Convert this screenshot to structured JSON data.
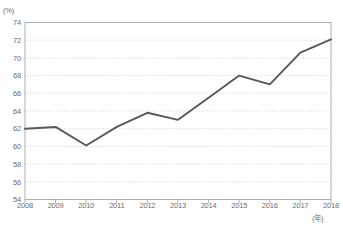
{
  "chart_data": {
    "type": "line",
    "title": "",
    "subtitle": "",
    "xlabel": "(年)",
    "ylabel": "(%)",
    "categories": [
      "2008",
      "2009",
      "2010",
      "2011",
      "2012",
      "2013",
      "2014",
      "2015",
      "2016",
      "2017",
      "2018"
    ],
    "x": [
      2008,
      2009,
      2010,
      2011,
      2012,
      2013,
      2014,
      2015,
      2016,
      2017,
      2018
    ],
    "values": [
      62.0,
      62.2,
      60.1,
      62.2,
      63.8,
      63.0,
      65.5,
      68.0,
      67.0,
      70.6,
      72.1
    ],
    "series": [
      {
        "name": "",
        "values": [
          62.0,
          62.2,
          60.1,
          62.2,
          63.8,
          63.0,
          65.5,
          68.0,
          67.0,
          70.6,
          72.1
        ]
      }
    ],
    "ylim": [
      54,
      74
    ],
    "ytick_step": 2,
    "yticks": [
      54,
      56,
      58,
      60,
      62,
      64,
      66,
      68,
      70,
      72,
      74
    ],
    "ytick_labels": [
      "54",
      "56",
      "58",
      "60",
      "62",
      "64",
      "66",
      "68",
      "70",
      "72",
      "74"
    ],
    "xticks": [
      2008,
      2009,
      2010,
      2011,
      2012,
      2013,
      2014,
      2015,
      2016,
      2017,
      2018
    ],
    "xtick_labels": [
      "2008",
      "2009",
      "2010",
      "2011",
      "2012",
      "2013",
      "2014",
      "2015",
      "2016",
      "2017",
      "2018"
    ],
    "grid": true,
    "grid_axis": "y",
    "grid_style": "dotted",
    "legend": false,
    "legend_position": "none",
    "markers": false,
    "annotations": []
  },
  "style": {
    "line_color": "#585858",
    "grid_color": "#b9b9b9",
    "frame_color": "#9a9a9a",
    "text_color": "#6d6d6d",
    "background": "#ffffff",
    "line_width": 1.9
  },
  "geometry": {
    "plot_left": 25,
    "plot_right": 331,
    "plot_top": 22.5,
    "plot_bottom": 199.5,
    "tick_label_y": 208,
    "y_label_x": 21
  }
}
